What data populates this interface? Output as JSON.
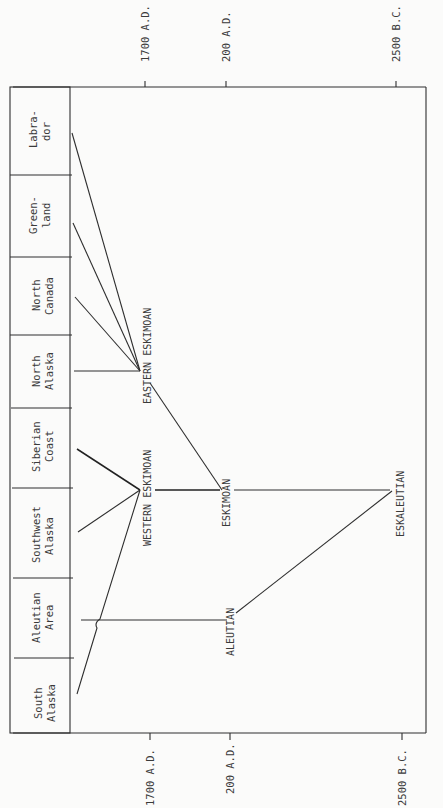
{
  "diagram": {
    "title": "",
    "orientation": "rotated 90 degrees clockwise (time axis runs left to right, regions listed top to bottom)",
    "time_axis": {
      "ticks": [
        {
          "label": "1700 A.D.",
          "x": 145
        },
        {
          "label": "200 A.D.",
          "x": 226
        },
        {
          "label": "2500 B.C.",
          "x": 396
        }
      ]
    },
    "regions": [
      {
        "line1": "Labra-",
        "line2": "dor"
      },
      {
        "line1": "Green-",
        "line2": "land"
      },
      {
        "line1": "North",
        "line2": "Canada"
      },
      {
        "line1": "North",
        "line2": "Alaska"
      },
      {
        "line1": "Siberian",
        "line2": "Coast"
      },
      {
        "line1": "Southwest",
        "line2": "Alaska"
      },
      {
        "line1": "Aleutian",
        "line2": "Area"
      },
      {
        "line1": "South",
        "line2": "Alaska"
      }
    ],
    "nodes": {
      "eastern_eskimoan": "EASTERN ESKIMOAN",
      "western_eskimoan": "WESTERN ESKIMOAN",
      "eskimoan": "ESKIMOAN",
      "aleutian": "ALEUTIAN",
      "eskaleutian": "ESKALEUTIAN"
    },
    "edges": [
      {
        "from": "Labrador",
        "to": "EASTERN ESKIMOAN"
      },
      {
        "from": "Greenland",
        "to": "EASTERN ESKIMOAN"
      },
      {
        "from": "North Canada",
        "to": "EASTERN ESKIMOAN"
      },
      {
        "from": "North Alaska",
        "to": "EASTERN ESKIMOAN"
      },
      {
        "from": "Siberian Coast",
        "to": "WESTERN ESKIMOAN"
      },
      {
        "from": "Southwest Alaska",
        "to": "WESTERN ESKIMOAN"
      },
      {
        "from": "South Alaska",
        "to": "WESTERN ESKIMOAN"
      },
      {
        "from": "Aleutian Area",
        "to": "ALEUTIAN"
      },
      {
        "from": "EASTERN ESKIMOAN",
        "to": "ESKIMOAN"
      },
      {
        "from": "WESTERN ESKIMOAN",
        "to": "ESKIMOAN"
      },
      {
        "from": "ESKIMOAN",
        "to": "ESKALEUTIAN"
      },
      {
        "from": "ALEUTIAN",
        "to": "ESKALEUTIAN"
      }
    ]
  }
}
